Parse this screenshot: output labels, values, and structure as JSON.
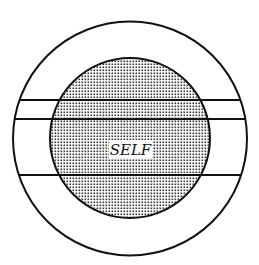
{
  "diagram": {
    "center_label": "SELF",
    "colors": {
      "background": "#ffffff",
      "stroke": "#111111",
      "dot": "#333333"
    },
    "outer_circle": {
      "cx": 130,
      "cy": 138.5,
      "r": 117
    },
    "inner_circle": {
      "cx": 130,
      "cy": 138,
      "r": 80,
      "fill": "dotted"
    },
    "horizontal_lines_y": [
      100,
      119,
      175
    ]
  }
}
